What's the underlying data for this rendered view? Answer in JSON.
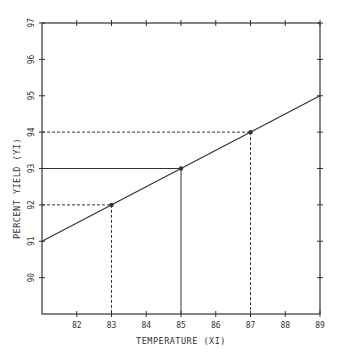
{
  "chart_data": {
    "type": "line",
    "title": "",
    "xlabel": "TEMPERATURE (XI)",
    "ylabel": "PERCENT YIELD (YI)",
    "xlim": [
      81,
      89
    ],
    "ylim": [
      89,
      97
    ],
    "x_ticks": [
      82,
      83,
      84,
      85,
      86,
      87,
      88,
      89
    ],
    "y_ticks": [
      90,
      91,
      92,
      93,
      94,
      95,
      96,
      97
    ],
    "grid": false,
    "series": [
      {
        "name": "regression line",
        "style": "solid",
        "x": [
          81,
          89
        ],
        "y": [
          91,
          95
        ]
      },
      {
        "name": "points",
        "style": "markers",
        "x": [
          83,
          85,
          87
        ],
        "y": [
          92,
          93,
          94
        ]
      }
    ],
    "guides": [
      {
        "x": 83,
        "y": 92,
        "style": "dashed"
      },
      {
        "x": 85,
        "y": 93,
        "style": "solid"
      },
      {
        "x": 87,
        "y": 94,
        "style": "dashed"
      }
    ]
  },
  "colors": {
    "ink": "#333333",
    "background": "#ffffff"
  },
  "layout": {
    "left": 42,
    "right": 320,
    "top": 23,
    "bottom": 314
  }
}
